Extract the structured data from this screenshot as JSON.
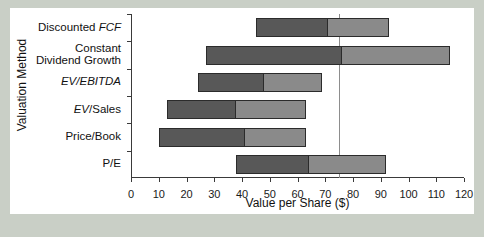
{
  "chart_data": {
    "type": "bar",
    "orientation": "horizontal",
    "subtype": "floating-range-bar",
    "title": "",
    "xlabel": "Value per Share ($)",
    "ylabel": "Valuation Method",
    "xlim": [
      0,
      120
    ],
    "xticks": [
      0,
      10,
      20,
      30,
      40,
      50,
      60,
      70,
      80,
      90,
      100,
      110,
      120
    ],
    "xticklabels": [
      "0",
      "10",
      "20",
      "30",
      "40",
      "50",
      "60",
      "70",
      "80",
      "90",
      "100",
      "110",
      "120"
    ],
    "grid": false,
    "legend": null,
    "reference_line": {
      "value": 75,
      "style": "solid-thin",
      "color": "#8d8d8d"
    },
    "categories": [
      "Discounted FCF",
      "Constant Dividend Growth",
      "EV/EBITDA",
      "EV/Sales",
      "Price/Book",
      "P/E"
    ],
    "category_labels_html": [
      "Discounted <i>FCF</i>",
      "Constant<br>Dividend Growth",
      "<i>EV/EBITDA</i>",
      "<i>EV</i>/Sales",
      "Price/Book",
      "P/E"
    ],
    "bars": [
      {
        "category": "Discounted FCF",
        "low": 45,
        "mid": 71,
        "high": 93
      },
      {
        "category": "Constant Dividend Growth",
        "low": 27,
        "mid": 76,
        "high": 115
      },
      {
        "category": "EV/EBITDA",
        "low": 24,
        "mid": 48,
        "high": 69
      },
      {
        "category": "EV/Sales",
        "low": 13,
        "mid": 38,
        "high": 63
      },
      {
        "category": "Price/Book",
        "low": 10,
        "mid": 41,
        "high": 63
      },
      {
        "category": "P/E",
        "low": 38,
        "mid": 64,
        "high": 92
      }
    ],
    "series": [
      {
        "name": "lower range",
        "color": "#585858",
        "values": [
          26,
          49,
          24,
          25,
          31,
          26
        ]
      },
      {
        "name": "upper range",
        "color": "#8a8a8a",
        "values": [
          22,
          39,
          21,
          25,
          22,
          28
        ]
      }
    ]
  },
  "colors": {
    "background": "#c9cfc6",
    "panel": "#ffffff",
    "axis": "#3a3a3a",
    "bar_low": "#585858",
    "bar_high": "#8a8a8a",
    "refline": "#8d8d8d",
    "text": "#111111"
  }
}
